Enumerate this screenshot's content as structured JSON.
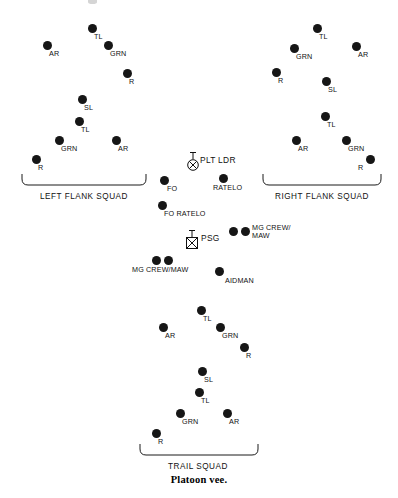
{
  "figure": {
    "caption": "Platoon vee.",
    "caption_y": 474
  },
  "squads": [
    {
      "id": "left-flank-squad",
      "label": "LEFT FLANK SQUAD",
      "label_x": 84,
      "label_y": 192,
      "brace": {
        "x": 21,
        "y": 173,
        "width": 126,
        "height": 13
      },
      "members": [
        {
          "role": "TL",
          "x": 88,
          "y": 24,
          "lx": 94,
          "ly": 33
        },
        {
          "role": "AR",
          "x": 43,
          "y": 41,
          "lx": 49,
          "ly": 50
        },
        {
          "role": "GRN",
          "x": 104,
          "y": 41,
          "lx": 110,
          "ly": 50
        },
        {
          "role": "R",
          "x": 123,
          "y": 69,
          "lx": 129,
          "ly": 78
        },
        {
          "role": "SL",
          "x": 78,
          "y": 95,
          "lx": 84,
          "ly": 104
        },
        {
          "role": "TL",
          "x": 75,
          "y": 117,
          "lx": 81,
          "ly": 126
        },
        {
          "role": "GRN",
          "x": 55,
          "y": 136,
          "lx": 61,
          "ly": 145
        },
        {
          "role": "AR",
          "x": 112,
          "y": 136,
          "lx": 118,
          "ly": 145
        },
        {
          "role": "R",
          "x": 32,
          "y": 155,
          "lx": 38,
          "ly": 164
        }
      ]
    },
    {
      "id": "right-flank-squad",
      "label": "RIGHT FLANK SQUAD",
      "label_x": 322,
      "label_y": 192,
      "brace": {
        "x": 262,
        "y": 173,
        "width": 120,
        "height": 13
      },
      "members": [
        {
          "role": "TL",
          "x": 313,
          "y": 24,
          "lx": 319,
          "ly": 33
        },
        {
          "role": "GRN",
          "x": 290,
          "y": 44,
          "lx": 296,
          "ly": 53
        },
        {
          "role": "AR",
          "x": 352,
          "y": 42,
          "lx": 358,
          "ly": 51
        },
        {
          "role": "R",
          "x": 272,
          "y": 68,
          "lx": 278,
          "ly": 77
        },
        {
          "role": "SL",
          "x": 322,
          "y": 77,
          "lx": 328,
          "ly": 86
        },
        {
          "role": "TL",
          "x": 321,
          "y": 112,
          "lx": 327,
          "ly": 121
        },
        {
          "role": "AR",
          "x": 292,
          "y": 136,
          "lx": 298,
          "ly": 145
        },
        {
          "role": "GRN",
          "x": 342,
          "y": 136,
          "lx": 348,
          "ly": 145
        },
        {
          "role": "R",
          "x": 366,
          "y": 155,
          "lx": 358,
          "ly": 164
        }
      ]
    },
    {
      "id": "trail-squad",
      "label": "TRAIL SQUAD",
      "label_x": 198,
      "label_y": 462,
      "brace": {
        "x": 139,
        "y": 443,
        "width": 120,
        "height": 13
      },
      "members": [
        {
          "role": "TL",
          "x": 197,
          "y": 306,
          "lx": 203,
          "ly": 315
        },
        {
          "role": "AR",
          "x": 159,
          "y": 323,
          "lx": 165,
          "ly": 332
        },
        {
          "role": "GRN",
          "x": 216,
          "y": 323,
          "lx": 222,
          "ly": 332
        },
        {
          "role": "R",
          "x": 240,
          "y": 343,
          "lx": 246,
          "ly": 352
        },
        {
          "role": "SL",
          "x": 198,
          "y": 367,
          "lx": 204,
          "ly": 376
        },
        {
          "role": "TL",
          "x": 195,
          "y": 388,
          "lx": 201,
          "ly": 397
        },
        {
          "role": "GRN",
          "x": 176,
          "y": 409,
          "lx": 182,
          "ly": 418
        },
        {
          "role": "AR",
          "x": 223,
          "y": 409,
          "lx": 229,
          "ly": 418
        },
        {
          "role": "R",
          "x": 152,
          "y": 429,
          "lx": 158,
          "ly": 438
        }
      ]
    }
  ],
  "headquarters": {
    "symbols": [
      {
        "id": "plt-ldr",
        "type": "circle-x-antenna",
        "label": "PLT LDR",
        "x": 185,
        "y": 150,
        "label_x": 200,
        "label_y": 155
      },
      {
        "id": "psg",
        "type": "square-x-antenna",
        "label": "PSG",
        "x": 184,
        "y": 228,
        "label_x": 201,
        "label_y": 233
      }
    ],
    "members": [
      {
        "role": "FO",
        "x": 160,
        "y": 176,
        "lx": 167,
        "ly": 185,
        "lines": 1
      },
      {
        "role": "RATELO",
        "x": 219,
        "y": 174,
        "lx": 213,
        "ly": 184,
        "lines": 1
      },
      {
        "role": "FO RATELO",
        "x": 158,
        "y": 201,
        "lx": 164,
        "ly": 210,
        "lines": 1
      },
      {
        "role": "MG CREW/\nMAW",
        "x": 229,
        "y": 227,
        "lx": 252,
        "ly": 224,
        "lines": 2
      },
      {
        "role": "",
        "x": 241,
        "y": 227,
        "lx": 0,
        "ly": 0,
        "lines": 0
      },
      {
        "role": "MG CREW/MAW",
        "x": 152,
        "y": 256,
        "lx": 132,
        "ly": 266,
        "lines": 1
      },
      {
        "role": "",
        "x": 164,
        "y": 256,
        "lx": 0,
        "ly": 0,
        "lines": 0
      },
      {
        "role": "AIDMAN",
        "x": 215,
        "y": 267,
        "lx": 225,
        "ly": 277,
        "lines": 1
      }
    ]
  }
}
